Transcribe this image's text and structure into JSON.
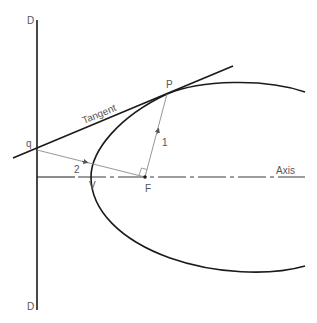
{
  "diagram": {
    "colors": {
      "background": "#ffffff",
      "primary_line": "#1a1a1a",
      "construction_line": "#8a8a8a",
      "label": "#555555"
    },
    "labels": {
      "directrix_top": "D",
      "directrix_bottom": "D",
      "tangent": "Tangent",
      "point_p": "P",
      "point_q": "q",
      "focus": "F",
      "vertex": "V",
      "axis": "Axis",
      "line_1": "1",
      "line_2": "2"
    },
    "elements": [
      {
        "name": "directrix",
        "type": "line",
        "from": [
          37,
          20
        ],
        "to": [
          37,
          310
        ]
      },
      {
        "name": "axis",
        "type": "dash-dot line",
        "from": [
          37,
          177
        ],
        "to": [
          305,
          177
        ]
      },
      {
        "name": "tangent",
        "type": "line",
        "from": [
          13,
          158
        ],
        "to": [
          233,
          66
        ]
      },
      {
        "name": "parabola",
        "type": "curve",
        "vertex": [
          91,
          177
        ],
        "ends": [
          [
            305,
            92
          ],
          [
            305,
            266
          ]
        ]
      },
      {
        "name": "segment-1",
        "type": "arrow line",
        "from": [
          145,
          177
        ],
        "to": [
          167,
          94
        ]
      },
      {
        "name": "segment-2",
        "type": "arrow line",
        "from": [
          37,
          150
        ],
        "to": [
          145,
          177
        ]
      }
    ],
    "points": {
      "P": [
        167,
        94
      ],
      "q": [
        37,
        150
      ],
      "F": [
        145,
        177
      ],
      "V": [
        91,
        177
      ]
    }
  }
}
